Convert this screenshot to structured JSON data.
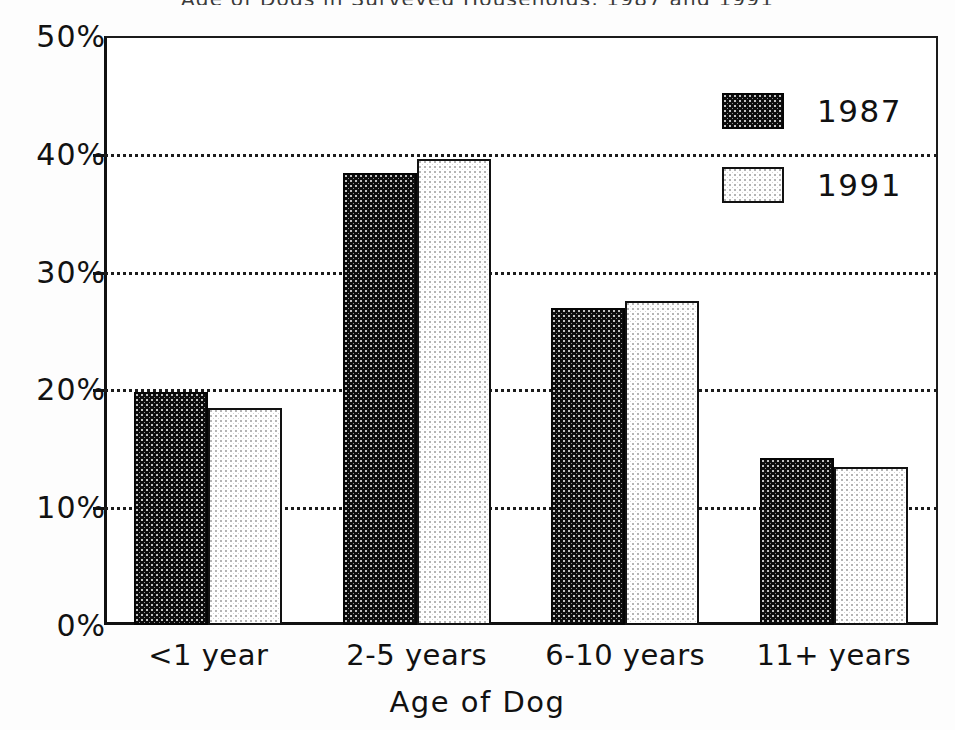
{
  "chart_data": {
    "type": "bar",
    "title": "",
    "xlabel": "Age of Dog",
    "ylabel": "",
    "categories": [
      "<1 year",
      "2-5 years",
      "6-10 years",
      "11+ years"
    ],
    "series": [
      {
        "name": "1987",
        "values": [
          19.8,
          38.4,
          26.9,
          14.2
        ]
      },
      {
        "name": "1991",
        "values": [
          18.4,
          39.6,
          27.5,
          13.4
        ]
      }
    ],
    "ylim": [
      0,
      50
    ],
    "yticks": [
      0,
      10,
      20,
      30,
      40,
      50
    ],
    "ytick_labels": [
      "0%",
      "10%",
      "20%",
      "30%",
      "40%",
      "50%"
    ],
    "grid": "horizontal-dotted",
    "legend_position": "top-right",
    "colors": {
      "series_1987": "#0d0d0d",
      "series_1991": "#ffffff",
      "outline": "#111111",
      "gridline": "#1c1c1c",
      "background": "#fdfdfd"
    }
  },
  "legend": {
    "entries": [
      {
        "label": "1987",
        "swatch": "dark-dotted-swatch"
      },
      {
        "label": "1991",
        "swatch": "light-dotted-swatch"
      }
    ]
  },
  "axis": {
    "x_title": "Age of Dog",
    "x_tick_labels": [
      "<1 year",
      "2-5 years",
      "6-10 years",
      "11+ years"
    ],
    "y_tick_labels": [
      "0%",
      "10%",
      "20%",
      "30%",
      "40%",
      "50%"
    ]
  },
  "header": {
    "clipped_title": "Age of Dogs in Surveyed Households, 1987 and 1991"
  }
}
